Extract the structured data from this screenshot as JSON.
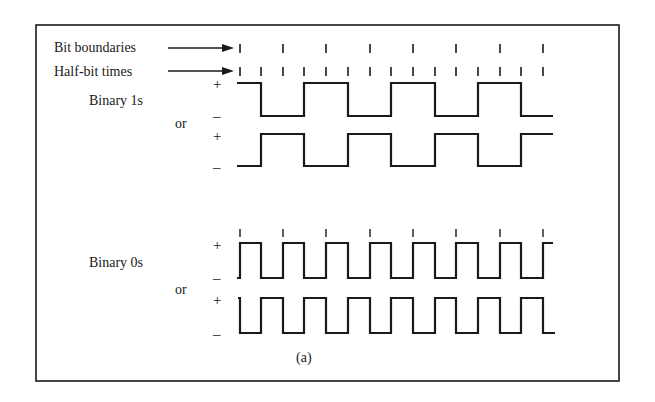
{
  "figure": {
    "caption": "(a)",
    "labels": {
      "bit_boundaries": "Bit boundaries",
      "half_bit_times": "Half-bit times",
      "binary_ones": "Binary 1s",
      "binary_zeros": "Binary 0s",
      "or_1": "or",
      "or_0": "or",
      "plus": "+",
      "minus": "–"
    },
    "colors": {
      "line": "#1a1a1a",
      "background": "#ffffff"
    },
    "bit_count": 7,
    "ones_waveforms": [
      {
        "name": "binary-1s-variant-a",
        "half_bit_levels": [
          "+",
          "-",
          "+",
          "-",
          "+",
          "-",
          "+",
          "-",
          "+",
          "-",
          "+",
          "-",
          "+",
          "-"
        ]
      },
      {
        "name": "binary-1s-variant-b",
        "half_bit_levels": [
          "-",
          "+",
          "-",
          "+",
          "-",
          "+",
          "-",
          "+",
          "-",
          "+",
          "-",
          "+",
          "-",
          "+"
        ]
      }
    ],
    "zeros_waveforms": [
      {
        "name": "binary-0s-variant-a",
        "half_bit_levels": [
          "+",
          "-",
          "+",
          "-",
          "+",
          "-",
          "+",
          "-",
          "+",
          "-",
          "+",
          "-",
          "+",
          "-"
        ]
      },
      {
        "name": "binary-0s-variant-b",
        "half_bit_levels": [
          "-",
          "+",
          "-",
          "+",
          "-",
          "+",
          "-",
          "+",
          "-",
          "+",
          "-",
          "+",
          "-",
          "+"
        ]
      }
    ]
  }
}
